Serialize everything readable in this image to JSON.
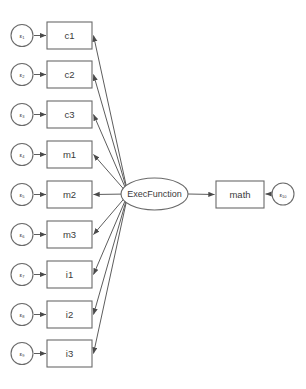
{
  "diagram": {
    "title": "",
    "type": "structural-equation-model-path-diagram",
    "background_color": "#ffffff",
    "stroke_color": "#6a6a6a",
    "text_color": "#3a3a3a",
    "latent": {
      "name": "exec-function",
      "label": "ExecFunction",
      "shape": "ellipse",
      "cx": 154.5,
      "cy": 194,
      "rx": 33.5,
      "ry": 16
    },
    "outcome": {
      "name": "math",
      "label": "math",
      "shape": "rectangle",
      "x": 216,
      "y": 181,
      "w": 48,
      "h": 27
    },
    "outcome_error": {
      "label": "ε",
      "subscript": "10",
      "cx": 283,
      "cy": 194,
      "r": 11
    },
    "indicators": [
      {
        "label": "c1",
        "error_label": "ε",
        "error_subscript": "1",
        "box_y": 22
      },
      {
        "label": "c2",
        "error_label": "ε",
        "error_subscript": "2",
        "box_y": 61
      },
      {
        "label": "c3",
        "error_label": "ε",
        "error_subscript": "3",
        "box_y": 101
      },
      {
        "label": "m1",
        "error_label": "ε",
        "error_subscript": "4",
        "box_y": 141
      },
      {
        "label": "m2",
        "error_label": "ε",
        "error_subscript": "5",
        "box_y": 181
      },
      {
        "label": "m3",
        "error_label": "ε",
        "error_subscript": "6",
        "box_y": 221
      },
      {
        "label": "i1",
        "error_label": "ε",
        "error_subscript": "7",
        "box_y": 261
      },
      {
        "label": "i2",
        "error_label": "ε",
        "error_subscript": "8",
        "box_y": 301
      },
      {
        "label": "i3",
        "error_label": "ε",
        "error_subscript": "9",
        "box_y": 340
      }
    ],
    "geometry": {
      "box_x": 47,
      "box_w": 45,
      "box_h": 27,
      "err_cx": 22,
      "err_r": 11,
      "err_arrow_from": 34,
      "err_arrow_to": 46
    }
  }
}
